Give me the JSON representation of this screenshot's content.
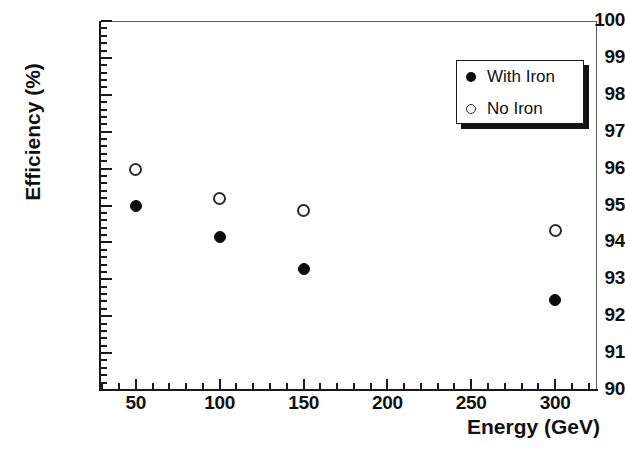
{
  "chart_data": {
    "type": "scatter",
    "title": "",
    "xlabel": "Energy (GeV)",
    "ylabel": "Efficiency (%)",
    "xlim": [
      28,
      325
    ],
    "ylim": [
      90,
      100
    ],
    "grid": false,
    "legend_position": "top-right",
    "x_ticks": [
      50,
      100,
      150,
      200,
      250,
      300
    ],
    "x_tick_labels": [
      "50",
      "100",
      "150",
      "200",
      "250",
      "300"
    ],
    "x_minor_step": 10,
    "y_ticks": [
      90,
      91,
      92,
      93,
      94,
      95,
      96,
      97,
      98,
      99,
      100
    ],
    "y_tick_labels": [
      "90",
      "91",
      "92",
      "93",
      "94",
      "95",
      "96",
      "97",
      "98",
      "99",
      "100"
    ],
    "y_minor_step": 0.2,
    "series": [
      {
        "name": "With Iron",
        "marker": "filled-circle",
        "color": "#0d0d0d",
        "x": [
          50,
          100,
          150,
          300
        ],
        "values": [
          95.0,
          94.15,
          93.27,
          92.45
        ]
      },
      {
        "name": "No Iron",
        "marker": "open-circle",
        "color": "#2b2b2b",
        "x": [
          50,
          100,
          150,
          300
        ],
        "values": [
          95.98,
          95.2,
          94.87,
          94.32
        ]
      }
    ]
  },
  "legend": {
    "entries": [
      {
        "label": "With Iron",
        "marker": "filled-circle"
      },
      {
        "label": "No Iron",
        "marker": "open-circle"
      }
    ]
  },
  "axes": {
    "x_title": "Energy (GeV)",
    "y_title": "Efficiency (%)"
  }
}
